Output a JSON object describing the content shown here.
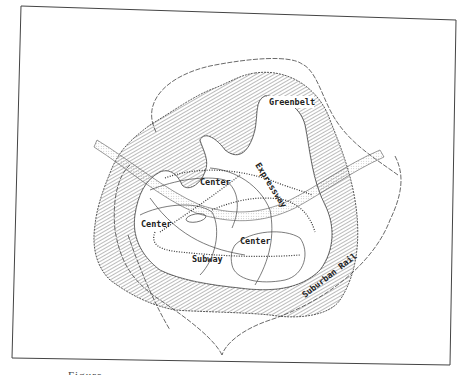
{
  "figure": {
    "type": "urban-plan-diagram",
    "caption_fragment": "Figure"
  },
  "labels": {
    "greenbelt": "Greenbelt",
    "expressway": "Expressway",
    "center_north": "Center",
    "center_west": "Center",
    "center_east": "Center",
    "subway": "Subway",
    "suburban_rail": "Suburban Rail"
  },
  "colors": {
    "ink": "#333333",
    "hatch": "#555555",
    "paper": "#ffffff"
  }
}
